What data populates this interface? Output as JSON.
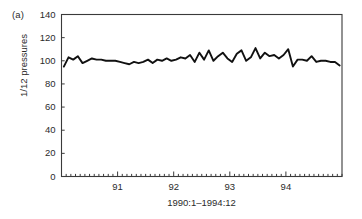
{
  "figure": {
    "panel_label": "(a)",
    "ylabel": "1/12 pressures",
    "xlabel": "1990:1–1994:12",
    "line_color": "#111111",
    "axis_color": "#3a3a3a",
    "background": "#ffffff"
  },
  "chart_data": {
    "type": "line",
    "title": "",
    "subtitle": "",
    "panel": "(a)",
    "xlabel": "1990:1–1994:12",
    "ylabel": "1/12 pressures",
    "ylim": [
      0,
      140
    ],
    "yticks": [
      0,
      20,
      40,
      60,
      80,
      100,
      120,
      140
    ],
    "ytick_labels": [
      "0",
      "20",
      "40",
      "60",
      "80",
      "100",
      "120",
      "140"
    ],
    "xlim": [
      1990.0,
      1995.0
    ],
    "xticks": [
      1991,
      1992,
      1993,
      1994
    ],
    "xtick_labels": [
      "91",
      "92",
      "93",
      "94"
    ],
    "minor_xticks_per_year": 12,
    "grid": false,
    "legend": null,
    "x": [
      "1990:1",
      "1990:2",
      "1990:3",
      "1990:4",
      "1990:5",
      "1990:6",
      "1990:7",
      "1990:8",
      "1990:9",
      "1990:10",
      "1990:11",
      "1990:12",
      "1991:1",
      "1991:2",
      "1991:3",
      "1991:4",
      "1991:5",
      "1991:6",
      "1991:7",
      "1991:8",
      "1991:9",
      "1991:10",
      "1991:11",
      "1991:12",
      "1992:1",
      "1992:2",
      "1992:3",
      "1992:4",
      "1992:5",
      "1992:6",
      "1992:7",
      "1992:8",
      "1992:9",
      "1992:10",
      "1992:11",
      "1992:12",
      "1993:1",
      "1993:2",
      "1993:3",
      "1993:4",
      "1993:5",
      "1993:6",
      "1993:7",
      "1993:8",
      "1993:9",
      "1993:10",
      "1993:11",
      "1993:12",
      "1994:1",
      "1994:2",
      "1994:3",
      "1994:4",
      "1994:5",
      "1994:6",
      "1994:7",
      "1994:8",
      "1994:9",
      "1994:10",
      "1994:11",
      "1994:12"
    ],
    "series": [
      {
        "name": "1/12 pressures",
        "values": [
          95,
          103,
          101,
          104,
          98,
          100,
          102,
          101,
          101,
          100,
          100,
          100,
          99,
          98,
          97,
          99,
          98,
          99,
          101,
          98,
          101,
          100,
          102,
          100,
          101,
          103,
          102,
          105,
          99,
          107,
          101,
          109,
          100,
          104,
          107,
          102,
          99,
          106,
          109,
          100,
          103,
          111,
          102,
          107,
          104,
          105,
          102,
          105,
          110,
          95,
          101,
          101,
          100,
          104,
          99,
          100,
          100,
          99,
          99,
          96
        ]
      }
    ]
  }
}
